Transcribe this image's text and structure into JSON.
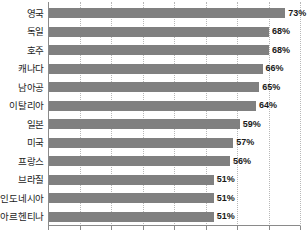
{
  "chart_data": {
    "type": "bar",
    "orientation": "horizontal",
    "title": "",
    "subtitle": "",
    "xlabel": "",
    "ylabel": "",
    "xlim": [
      0,
      80
    ],
    "ylim": null,
    "grid": true,
    "grid_axis": "x",
    "legend": false,
    "legend_position": "none",
    "value_suffix": "%",
    "categories": [
      "영국",
      "독일",
      "호주",
      "캐나다",
      "남아공",
      "이탈리아",
      "일본",
      "미국",
      "프랑스",
      "브라질",
      "인도네시아",
      "아르헨티나"
    ],
    "values": [
      73,
      68,
      68,
      66,
      65,
      64,
      59,
      57,
      56,
      51,
      51,
      51
    ],
    "value_labels": [
      "73%",
      "68%",
      "68%",
      "66%",
      "65%",
      "64%",
      "59%",
      "57%",
      "56%",
      "51%",
      "51%",
      "51%"
    ],
    "tick_values": [
      0,
      10,
      20,
      30,
      40,
      50,
      60,
      70,
      80
    ],
    "tick_labels": [
      "",
      "",
      "",
      "",
      "",
      "",
      "",
      "",
      ""
    ],
    "colors": {
      "bar": "#808080",
      "gridline": "#b8b8b8",
      "axis": "#8a8a8a",
      "label_text": "#1c1c1c",
      "value_text": "#1a1a1a",
      "background": "#ffffff"
    }
  }
}
